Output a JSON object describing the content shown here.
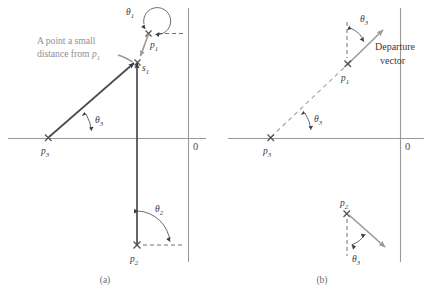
{
  "figure": {
    "background": "#ffffff",
    "width": 428,
    "height": 297,
    "colors": {
      "axis": "#9a9a9a",
      "vector_solid": "#4a4a52",
      "vector_gray": "#9a9a9a",
      "dashed_reference": "#6f6f78",
      "annotation_gray": "#8e8e96",
      "label": "#3a3a42"
    }
  },
  "panel_a": {
    "caption": "(a)",
    "origin_label": "0",
    "annotation": {
      "line1": "A point a small",
      "line2_prefix": "distance from ",
      "line2_symbol": "p",
      "line2_subscript": "1"
    },
    "labels": {
      "theta1": "θ",
      "theta1_sub": "1",
      "theta2": "θ",
      "theta2_sub": "2",
      "theta3": "θ",
      "theta3_sub": "3",
      "p1": "p",
      "p1_sub": "1",
      "p2": "p",
      "p2_sub": "2",
      "p3": "p",
      "p3_sub": "3",
      "s1": "s",
      "s1_sub": "1"
    }
  },
  "panel_b": {
    "caption": "(b)",
    "origin_label": "0",
    "departure_vector": {
      "line1": "Departure",
      "line2": "vector"
    },
    "labels": {
      "theta3_top": "θ",
      "theta3_top_sub": "3",
      "theta3_bottom": "θ",
      "theta3_bottom_sub": "3",
      "theta3_p2": "θ",
      "theta3_p2_sub": "3",
      "p1": "p",
      "p1_sub": "1",
      "p2": "p",
      "p2_sub": "2",
      "p3": "p",
      "p3_sub": "3"
    }
  }
}
